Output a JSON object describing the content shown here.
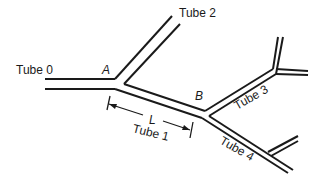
{
  "diagram": {
    "labels": {
      "tube0": "Tube 0",
      "tube1": "Tube 1",
      "tube2": "Tube 2",
      "tube3": "Tube 3",
      "tube4": "Tube 4",
      "junction_a": "A",
      "junction_b": "B",
      "length": "L"
    },
    "colors": {
      "line": "#1a1a1a",
      "background": "#ffffff"
    }
  }
}
